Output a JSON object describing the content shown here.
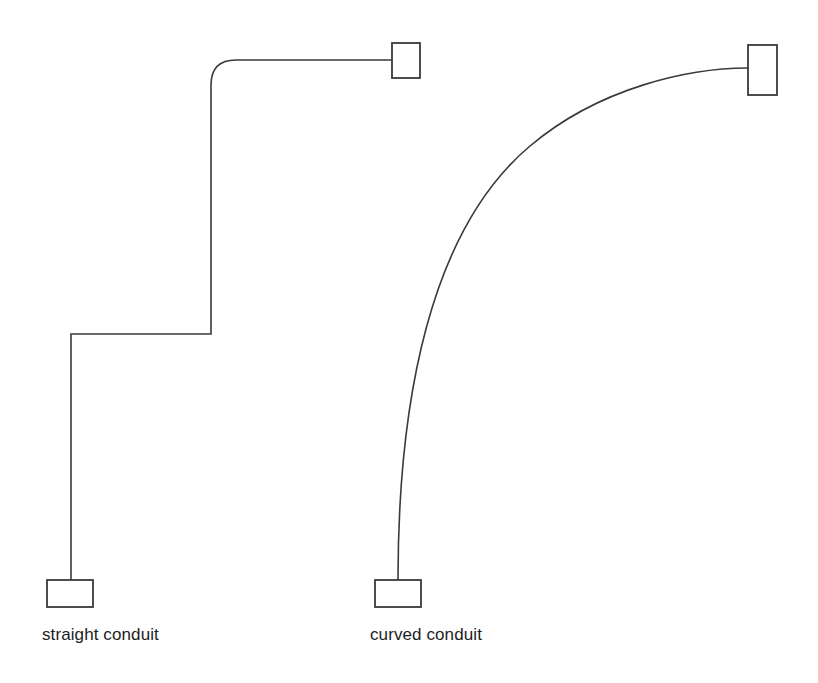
{
  "diagram": {
    "background_color": "#ffffff",
    "line_color": "#3a3a3a",
    "text_color": "#1d1d1d",
    "width": 818,
    "height": 683,
    "figures": [
      {
        "id": "straight-conduit",
        "caption": "straight conduit",
        "path_type": "orthogonal-stepped",
        "path_d": "M 71 580 L 71 334 L 211 334 L 211 85 Q 211 60 236 60 L 392 60",
        "start_terminal": {
          "x": 47,
          "y": 580,
          "width": 46,
          "height": 27,
          "orientation": "horizontal"
        },
        "end_terminal": {
          "x": 392,
          "y": 43,
          "width": 28,
          "height": 35,
          "orientation": "vertical"
        },
        "caption_x": 42,
        "caption_y": 626
      },
      {
        "id": "curved-conduit",
        "caption": "curved conduit",
        "path_type": "smooth-arc",
        "path_d": "M 398 580 C 398 400 430 230 530 146 C 600 87 690 68 748 68",
        "start_terminal": {
          "x": 375,
          "y": 580,
          "width": 46,
          "height": 27,
          "orientation": "horizontal"
        },
        "end_terminal": {
          "x": 748,
          "y": 45,
          "width": 29,
          "height": 50,
          "orientation": "vertical"
        },
        "caption_x": 370,
        "caption_y": 626
      }
    ],
    "labels": {
      "straight": "straight conduit",
      "curved": "curved conduit"
    }
  }
}
